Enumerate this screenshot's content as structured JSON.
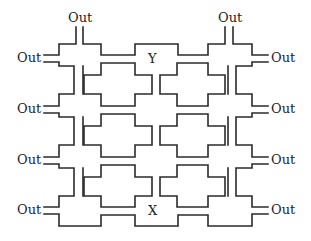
{
  "diagram": {
    "type": "maze-network",
    "colors": {
      "line": "#2b2b2b",
      "text": "#1e1e1e",
      "background": "#ffffff"
    },
    "labels": {
      "top_left_out": "Out",
      "top_right_out": "Out",
      "left_outs": [
        "Out",
        "Out",
        "Out",
        "Out"
      ],
      "right_outs": [
        "Out",
        "Out",
        "Out",
        "Out"
      ],
      "marker_top": "Y",
      "marker_bottom": "X"
    },
    "grid": {
      "columns": 2,
      "rows": 3,
      "block_shape": "cross"
    }
  }
}
